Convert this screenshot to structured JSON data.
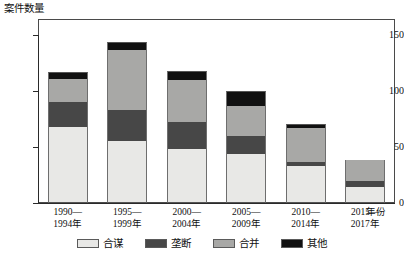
{
  "chart_data": {
    "type": "bar",
    "subtype": "stacked-bar",
    "title": "",
    "ylabel": "案件数量",
    "xlabel": "年份",
    "ylim": [
      0,
      150
    ],
    "yticks": [
      0,
      50,
      100,
      150
    ],
    "ytick_labels": [
      "0",
      "50",
      "100",
      "150"
    ],
    "grid": false,
    "legend_position": "bottom",
    "categories": [
      "1990—1994年",
      "1995—1999年",
      "2000—2004年",
      "2005—2009年",
      "2010—2014年",
      "2015—2017年"
    ],
    "category_lines": [
      [
        "1990—",
        "1994年"
      ],
      [
        "1995—",
        "1999年"
      ],
      [
        "2000—",
        "2004年"
      ],
      [
        "2005—",
        "2009年"
      ],
      [
        "2010—",
        "2014年"
      ],
      [
        "2015—",
        "2017年"
      ]
    ],
    "series": [
      {
        "name": "合谋",
        "color": "#e8e8e6",
        "values": [
          68,
          55,
          48,
          44,
          33,
          14
        ]
      },
      {
        "name": "垄断",
        "color": "#474747",
        "values": [
          22,
          28,
          24,
          16,
          4,
          6
        ]
      },
      {
        "name": "合并",
        "color": "#a8a8a6",
        "values": [
          21,
          54,
          38,
          27,
          30,
          18
        ]
      },
      {
        "name": "其他",
        "color": "#111111",
        "values": [
          6,
          7,
          8,
          13,
          4,
          0
        ]
      }
    ],
    "totals": [
      117,
      144,
      118,
      100,
      71,
      38
    ]
  },
  "legend": {
    "items": [
      {
        "label": "合谋",
        "color": "#e8e8e6"
      },
      {
        "label": "垄断",
        "color": "#474747"
      },
      {
        "label": "合并",
        "color": "#a8a8a6"
      },
      {
        "label": "其他",
        "color": "#111111"
      }
    ]
  }
}
